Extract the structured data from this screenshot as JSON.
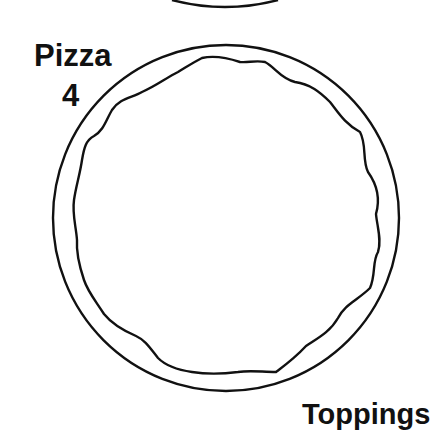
{
  "diagram": {
    "title": "Pizza",
    "number": "4",
    "caption": "Toppings",
    "stroke_color": "#111111",
    "background": "#ffffff"
  }
}
